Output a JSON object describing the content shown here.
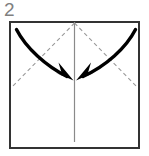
{
  "figure": {
    "step_label": "2",
    "step_label_color": "#808080",
    "title_semantic": "origami-fold-step-2",
    "paper": {
      "shape": "square",
      "x": 10,
      "y": 22,
      "width": 129,
      "height": 126,
      "stroke_color": "#333333",
      "fill_color": "#ffffff",
      "stroke_width": 1.6
    },
    "crease_vertical": {
      "label": "center-vertical-crease",
      "x1": 74.5,
      "y1": 22,
      "x2": 74.5,
      "y2": 142,
      "stroke_color": "#8a8a8a",
      "stroke_width": 1.2,
      "style": "solid"
    },
    "fold_lines": [
      {
        "label": "left-diagonal-fold-line",
        "x1": 74.5,
        "y1": 23,
        "x2": 11,
        "y2": 88,
        "stroke_color": "#9a9a9a",
        "stroke_width": 1.1,
        "style": "dashed",
        "dash_pattern": "4,3"
      },
      {
        "label": "right-diagonal-fold-line",
        "x1": 74.5,
        "y1": 23,
        "x2": 138,
        "y2": 88,
        "stroke_color": "#9a9a9a",
        "stroke_width": 1.1,
        "style": "dashed",
        "dash_pattern": "4,3"
      }
    ],
    "arrows": [
      {
        "label": "left-fold-arrow",
        "direction": "inward-right-down",
        "path": "M16.5,29.5 C26,48 46,66 67,76.5",
        "tip_x": 72,
        "tip_y": 79,
        "head_points": "73.5,80.5 55.5,72.5 62.5,76 58.5,62.5",
        "stroke_color": "#000000",
        "stroke_width": 3.4
      },
      {
        "label": "right-fold-arrow",
        "direction": "inward-left-down",
        "path": "M135.5,29.5 C126,48 106,66 83,76.5",
        "tip_x": 77.5,
        "tip_y": 79,
        "head_points": "76,80.5 94,72.5 87,76 91,62.5",
        "stroke_color": "#000000",
        "stroke_width": 3.4
      }
    ]
  }
}
